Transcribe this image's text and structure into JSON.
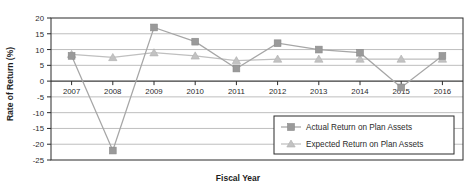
{
  "chart_data": {
    "type": "line",
    "title": "",
    "xlabel": "Fiscal Year",
    "ylabel": "Rate of Return (%)",
    "categories": [
      "2007",
      "2008",
      "2009",
      "2010",
      "2011",
      "2012",
      "2013",
      "2014",
      "2015",
      "2016"
    ],
    "x": [
      2007,
      2008,
      2009,
      2010,
      2011,
      2012,
      2013,
      2014,
      2015,
      2016
    ],
    "ylim": [
      -25,
      20
    ],
    "ytick_labels": [
      "20",
      "15",
      "10",
      "5",
      "0",
      "-5",
      "-10",
      "-15",
      "-20",
      "-25"
    ],
    "yticks": [
      20,
      15,
      10,
      5,
      0,
      -5,
      -10,
      -15,
      -20,
      -25
    ],
    "grid": "horizontal",
    "legend_position": "lower-right",
    "series": [
      {
        "name": "Actual Return on Plan Assets",
        "marker": "square",
        "color": "#9a9a9a",
        "values": [
          8,
          -22,
          17,
          12.5,
          4,
          12,
          10,
          9,
          -2,
          8
        ]
      },
      {
        "name": "Expected Return on Plan Assets",
        "marker": "triangle",
        "color": "#c2c2c2",
        "values": [
          8.5,
          7.5,
          9,
          8,
          6.5,
          7,
          7,
          7,
          7,
          7
        ]
      }
    ]
  },
  "axes": {
    "y_title": "Rate of Return (%)",
    "x_title": "Fiscal Year"
  },
  "legend": {
    "items": [
      {
        "label": "Actual Return on Plan Assets",
        "marker": "square"
      },
      {
        "label": "Expected Return on Plan Assets",
        "marker": "triangle"
      }
    ]
  },
  "colors": {
    "actual": "#9a9a9a",
    "expected": "#c2c2c2",
    "grid": "#b7b7b7",
    "frame": "#2a2a2a",
    "text": "#2b2b2b"
  }
}
